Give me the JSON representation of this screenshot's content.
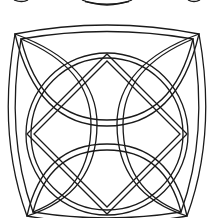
{
  "image": {
    "title": "Celtic knot coloring page",
    "description": "Black line-art Celtic knot: outer circle interlaced with a diamond and four pointed lens loops",
    "colors": {
      "background": "#ffffff",
      "line": "#1a1a1a"
    }
  },
  "elements": {
    "top_partial": "partial knot arc from previous figure (cropped at top)",
    "knot": "interlaced circle, diamond and four lens loops"
  }
}
